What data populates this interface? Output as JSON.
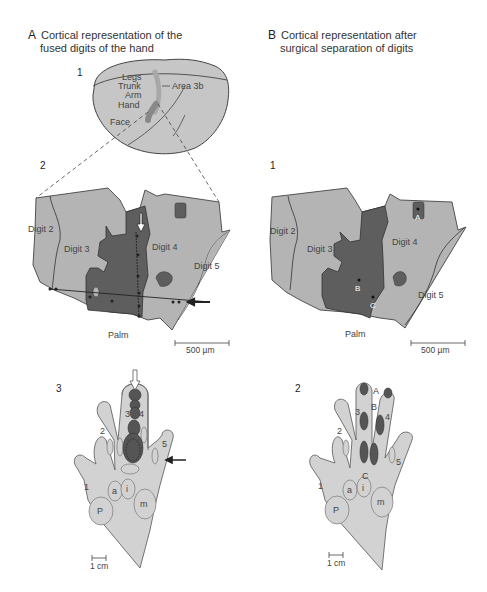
{
  "panel_a": {
    "letter": "A",
    "title_line1": "Cortical representation of the",
    "title_line2": "fused digits of the hand",
    "sub1": "1",
    "sub2": "2",
    "sub3": "3",
    "brain_labels": {
      "legs": "Legs",
      "trunk": "Trunk",
      "arm": "Arm",
      "hand": "Hand",
      "face": "Face",
      "area": "Area 3b"
    },
    "map_labels": {
      "digit2": "Digit 2",
      "digit3": "Digit 3",
      "digit4": "Digit 4",
      "digit5": "Digit 5",
      "palm": "Palm"
    },
    "scale_map": "500 µm",
    "hand_labels": {
      "d1": "1",
      "d2": "2",
      "d3": "3",
      "d4": "4",
      "d5": "5",
      "p": "P",
      "a": "a",
      "i": "i",
      "m": "m"
    },
    "scale_hand": "1 cm"
  },
  "panel_b": {
    "letter": "B",
    "title_line1": "Cortical representation after",
    "title_line2": "surgical separation of digits",
    "sub1": "1",
    "sub2": "2",
    "map_labels": {
      "digit2": "Digit 2",
      "digit3": "Digit 3",
      "digit4": "Digit 4",
      "digit5": "Digit 5",
      "palm": "Palm",
      "a": "A",
      "b": "B",
      "c": "C"
    },
    "scale_map": "500 µm",
    "hand_labels": {
      "d1": "1",
      "d2": "2",
      "d3": "3",
      "d4": "4",
      "d5": "5",
      "p": "P",
      "a": "a",
      "i": "i",
      "m": "m",
      "A": "A",
      "B": "B",
      "C": "C"
    },
    "scale_hand": "1 cm"
  },
  "colors": {
    "light_gray": "#b4b4b4",
    "dark_gray": "#5e5e5e",
    "hand_fill": "#d2d2d2",
    "outline": "#555555"
  }
}
